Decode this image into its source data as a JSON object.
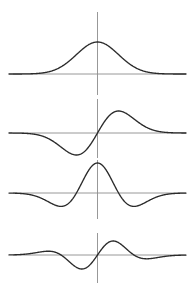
{
  "figure": {
    "title": "",
    "background_color": "#ffffff",
    "width": 196,
    "height": 300,
    "curve_color": "#2b2b2b",
    "axis_color": "#8c8c8c"
  },
  "chart_data": {
    "type": "line",
    "title": "",
    "subtitle": "",
    "xlabel": "",
    "ylabel": "",
    "grid": false,
    "legend_position": "none",
    "layout": "4 stacked panels, shared x-axis, vertical axis at x = 0",
    "xlim": [
      -4.2,
      4.2
    ],
    "panel_count": 4,
    "panels": [
      {
        "index": 0,
        "name": "gaussian",
        "label": "",
        "function": "exp(-x^2/2)",
        "description": "Gaussian bell curve, single positive peak centered at x = 0",
        "ylim": [
          -0.18,
          1.12
        ],
        "baseline_y": 0,
        "amplitude": 1.0,
        "peak_x": 0,
        "zero_crossings": [],
        "x": [
          -4.2,
          -3.8,
          -3.4,
          -3.0,
          -2.6,
          -2.2,
          -1.8,
          -1.4,
          -1.0,
          -0.6,
          -0.2,
          0.0,
          0.2,
          0.6,
          1.0,
          1.4,
          1.8,
          2.2,
          2.6,
          3.0,
          3.4,
          3.8,
          4.2
        ],
        "y": [
          0.0002,
          0.0007,
          0.003,
          0.011,
          0.034,
          0.089,
          0.198,
          0.375,
          0.607,
          0.835,
          0.98,
          1.0,
          0.98,
          0.835,
          0.607,
          0.375,
          0.198,
          0.089,
          0.034,
          0.011,
          0.003,
          0.0007,
          0.0002
        ]
      },
      {
        "index": 1,
        "name": "gaussian-first-derivative",
        "label": "",
        "function": "-x * exp(-x^2/2)",
        "description": "First derivative of the Gaussian: negative trough left of centre, positive crest right of centre, odd symmetry",
        "ylim": [
          -1.15,
          1.15
        ],
        "baseline_y": 0,
        "amplitude": 1.0,
        "trough_x": -1.0,
        "peak_x": 1.0,
        "zero_crossings": [
          0.0
        ],
        "x": [
          -4.2,
          -3.8,
          -3.4,
          -3.0,
          -2.6,
          -2.2,
          -1.8,
          -1.4,
          -1.0,
          -0.6,
          -0.2,
          0.0,
          0.2,
          0.6,
          1.0,
          1.4,
          1.8,
          2.2,
          2.6,
          3.0,
          3.4,
          3.8,
          4.2
        ],
        "y": [
          -0.0014,
          -0.0045,
          -0.017,
          -0.055,
          -0.146,
          -0.323,
          -0.588,
          -0.866,
          -1.0,
          -0.826,
          -0.324,
          0.0,
          0.324,
          0.826,
          1.0,
          0.866,
          0.588,
          0.323,
          0.146,
          0.055,
          0.017,
          0.0045,
          0.0014
        ]
      },
      {
        "index": 2,
        "name": "gaussian-second-derivative",
        "label": "",
        "function": "(1 - x^2) * exp(-x^2/2)",
        "description": "Second derivative of the Gaussian (Mexican hat / Ricker): positive central lobe with two shallow negative side lobes",
        "ylim": [
          -0.62,
          1.12
        ],
        "baseline_y": 0,
        "amplitude": 1.0,
        "peak_x": 0,
        "side_lobe_minima_x": [
          -1.73,
          1.73
        ],
        "side_lobe_depth": -0.45,
        "zero_crossings": [
          -1.0,
          1.0
        ],
        "x": [
          -4.2,
          -3.8,
          -3.4,
          -3.0,
          -2.6,
          -2.2,
          -1.8,
          -1.4,
          -1.0,
          -0.6,
          -0.2,
          0.0,
          0.2,
          0.6,
          1.0,
          1.4,
          1.8,
          2.2,
          2.6,
          3.0,
          3.4,
          3.8,
          4.2
        ],
        "y": [
          -0.003,
          -0.01,
          -0.031,
          -0.089,
          -0.2,
          -0.342,
          -0.44,
          -0.36,
          0.0,
          0.535,
          0.941,
          1.0,
          0.941,
          0.535,
          0.0,
          -0.36,
          -0.44,
          -0.342,
          -0.2,
          -0.089,
          -0.031,
          -0.01,
          -0.003
        ]
      },
      {
        "index": 3,
        "name": "gaussian-third-derivative",
        "label": "",
        "function": "(3x - x^3) * exp(-x^2/2)",
        "description": "Third derivative of the Gaussian: small positive outer bump on the left, deep trough before centre, tall crest after centre, small negative outer dip on the right; odd symmetry",
        "ylim": [
          -1.05,
          1.05
        ],
        "baseline_y": 0,
        "amplitude": 1.0,
        "trough_x": -0.62,
        "peak_x": 0.62,
        "outer_bump_x": [
          -2.33,
          2.33
        ],
        "outer_bump_amplitude": 0.36,
        "zero_crossings": [
          -1.732,
          0.0,
          1.732
        ],
        "x": [
          -4.2,
          -3.8,
          -3.4,
          -3.0,
          -2.6,
          -2.2,
          -1.8,
          -1.4,
          -1.0,
          -0.6,
          -0.2,
          0.0,
          0.2,
          0.6,
          1.0,
          1.4,
          1.8,
          2.2,
          2.6,
          3.0,
          3.4,
          3.8,
          4.2
        ],
        "y": [
          0.0056,
          0.0167,
          0.0561,
          0.16,
          0.3301,
          0.4725,
          0.3923,
          -0.0296,
          -0.8088,
          -0.9266,
          -0.4726,
          0.0,
          0.4726,
          0.9266,
          0.8088,
          0.0296,
          -0.3923,
          -0.4725,
          -0.3301,
          -0.16,
          -0.0561,
          -0.0167,
          -0.0056
        ]
      }
    ]
  },
  "geometry": {
    "axis_x_px": 97.5,
    "x_left_px": 13,
    "x_right_px": 186,
    "panels_px": [
      {
        "baseline_y": 74,
        "v_top": 12,
        "v_bottom": 95,
        "amp": 32,
        "x_left": 13,
        "x_right": 186
      },
      {
        "baseline_y": 133,
        "v_top": 99,
        "v_bottom": 158,
        "amp": 22,
        "x_left": 13,
        "x_right": 186
      },
      {
        "baseline_y": 193,
        "v_top": 160,
        "v_bottom": 219,
        "amp": 30,
        "x_left": 13,
        "x_right": 186
      },
      {
        "baseline_y": 255,
        "v_top": 233,
        "v_bottom": 283,
        "amp": 14,
        "x_left": 13,
        "x_right": 186
      }
    ]
  }
}
